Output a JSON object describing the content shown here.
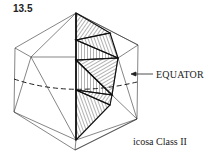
{
  "figure": {
    "number": "13.5",
    "caption": "icosa Class II",
    "equator_label": "EQUATOR",
    "arrow_icon": "left-arrow"
  },
  "colors": {
    "ink": "#222222",
    "background": "#ffffff"
  }
}
